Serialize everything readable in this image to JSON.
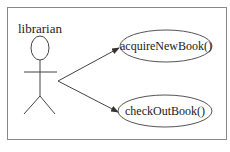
{
  "diagram": {
    "type": "uml-use-case",
    "actor": {
      "name": "librarian"
    },
    "use_cases": [
      {
        "label": "acquireNewBook()"
      },
      {
        "label": "checkOutBook()"
      }
    ],
    "associations": [
      {
        "from": "librarian",
        "to": "acquireNewBook()"
      },
      {
        "from": "librarian",
        "to": "checkOutBook()"
      }
    ],
    "colors": {
      "stroke": "#444444",
      "border": "#888888",
      "background": "#ffffff"
    }
  }
}
